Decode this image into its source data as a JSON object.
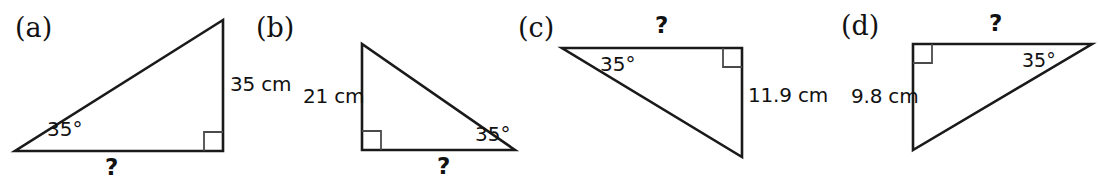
{
  "sheet": {
    "background_color": "#ffffff",
    "stroke_color": "#1a1a1a",
    "text_color": "#111111"
  },
  "figures": [
    {
      "id": "a",
      "part_label": "(a)",
      "angle_label": "35°",
      "vertical_side_label": "35 cm",
      "base_label": "?",
      "right_angle_marker": "right-angle-square",
      "description": "right triangle, right angle bottom-right, 35 degree angle bottom-left, vertical side 35 cm on the right, unknown base"
    },
    {
      "id": "b",
      "part_label": "(b)",
      "angle_label": "35°",
      "vertical_side_label": "21 cm",
      "base_label": "?",
      "right_angle_marker": "right-angle-square",
      "description": "right triangle, right angle bottom-left, 35 degree angle bottom-right, vertical side 21 cm on the left, unknown base"
    },
    {
      "id": "c",
      "part_label": "(c)",
      "angle_label": "35°",
      "vertical_side_label": "11.9 cm",
      "base_label": "?",
      "right_angle_marker": "right-angle-square",
      "description": "right triangle, right angle top-right, 35 degree angle top-left, vertical side 11.9 cm on the right, unknown top side"
    },
    {
      "id": "d",
      "part_label": "(d)",
      "angle_label": "35°",
      "vertical_side_label": "9.8 cm",
      "base_label": "?",
      "right_angle_marker": "right-angle-square",
      "description": "right triangle, right angle top-left, 35 degree angle top-right, vertical side 9.8 cm on the left, unknown top side"
    }
  ]
}
